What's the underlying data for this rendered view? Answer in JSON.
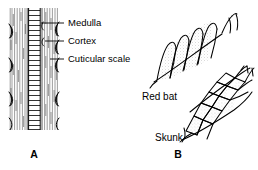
{
  "figure": {
    "title_absent": true,
    "background_color": "#ffffff",
    "ink_color": "#000000"
  },
  "panel_a": {
    "id_label": "A",
    "subject": "longitudinal-hair-shaft-cross-structure",
    "callouts": [
      {
        "key": "medulla",
        "label": "Medulla",
        "text_x": 74,
        "text_y": 26,
        "leader_from_x": 64,
        "leader_from_y": 23,
        "leader_to_x": 41,
        "leader_to_y": 23
      },
      {
        "key": "cortex",
        "label": "Cortex",
        "text_x": 74,
        "text_y": 44,
        "leader_from_x": 64,
        "leader_from_y": 41,
        "leader_to_x": 44,
        "leader_to_y": 41
      },
      {
        "key": "cuticular",
        "label": "Cuticular scale",
        "text_x": 74,
        "text_y": 62,
        "leader_from_x": 64,
        "leader_from_y": 59,
        "leader_to_x": 49,
        "leader_to_y": 59
      }
    ]
  },
  "panel_b": {
    "id_label": "B",
    "subject": "cuticular-scale-pattern-comparison",
    "specimens": [
      {
        "key": "red_bat",
        "label": "Red bat",
        "text_x": 142,
        "text_y": 100,
        "pattern": "elongate-diagonal-coronal-scales"
      },
      {
        "key": "skunk",
        "label": "Skunk",
        "text_x": 155,
        "text_y": 141,
        "pattern": "polygonal-mosaic-imbricate-scales"
      }
    ]
  }
}
